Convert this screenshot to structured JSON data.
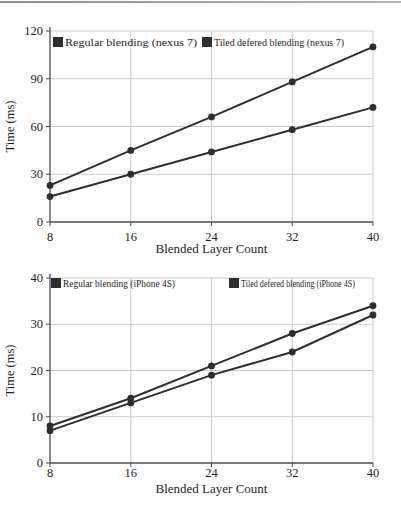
{
  "page": {
    "background": "#ffffff",
    "top_rule_color": "#8f8f8f",
    "text_color": "#1f1f1f",
    "grid_color": "#cccccc",
    "axis_color": "#4d4d4d"
  },
  "chart_data": [
    {
      "type": "line",
      "title": "",
      "xlabel": "Blended Layer Count",
      "ylabel": "Time (ms)",
      "x": [
        8,
        16,
        24,
        32,
        40
      ],
      "xticks": [
        8,
        16,
        24,
        32,
        40
      ],
      "xlim": [
        8,
        40
      ],
      "ylim": [
        0,
        120
      ],
      "yticks": [
        0,
        30,
        60,
        90,
        120
      ],
      "grid": true,
      "legend_position": "top-left-inside",
      "marker": "circle",
      "series": [
        {
          "name": "Regular blending (nexus 7)",
          "values": [
            23,
            45,
            66,
            88,
            110
          ],
          "color": "#2e2e2e"
        },
        {
          "name": "Tiled defered blending (nexus 7)",
          "values": [
            16,
            30,
            44,
            58,
            72
          ],
          "color": "#2e2e2e"
        }
      ]
    },
    {
      "type": "line",
      "title": "",
      "xlabel": "Blended Layer Count",
      "ylabel": "Time (ms)",
      "x": [
        8,
        16,
        24,
        32,
        40
      ],
      "xticks": [
        8,
        16,
        24,
        32,
        40
      ],
      "xlim": [
        8,
        40
      ],
      "ylim": [
        0,
        40
      ],
      "yticks": [
        0,
        10,
        20,
        30,
        40
      ],
      "grid": true,
      "legend_position": "top-left-inside",
      "marker": "circle",
      "series": [
        {
          "name": "Regular blending (iPhone 4S)",
          "values": [
            8,
            14,
            21,
            28,
            34
          ],
          "color": "#2e2e2e"
        },
        {
          "name": "Tiled defered blending (iPhone 4S)",
          "values": [
            7,
            13,
            19,
            24,
            32
          ],
          "color": "#2e2e2e"
        }
      ]
    }
  ]
}
